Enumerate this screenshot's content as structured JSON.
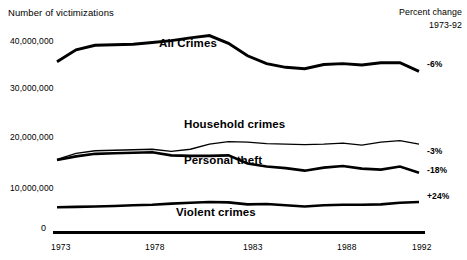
{
  "chart_data": {
    "type": "line",
    "title": "",
    "ylabel": "Number of victimizations",
    "xlabel": "",
    "x": [
      1973,
      1974,
      1975,
      1976,
      1977,
      1978,
      1979,
      1980,
      1981,
      1982,
      1983,
      1984,
      1985,
      1986,
      1987,
      1988,
      1989,
      1990,
      1991,
      1992
    ],
    "xlim": [
      1973,
      1992
    ],
    "ylim": [
      0,
      44000000
    ],
    "xticks": [
      "1973",
      "1978",
      "1983",
      "1988",
      "1992"
    ],
    "yticks": [
      "0",
      "10,000,000",
      "20,000,000",
      "30,000,000",
      "40,000,000"
    ],
    "grid": false,
    "legend": "inline-labels",
    "series": [
      {
        "name": "All Crimes",
        "percent_change_label": "-6%",
        "values": [
          35700000,
          38300000,
          39300000,
          39400000,
          39500000,
          39900000,
          40300000,
          40900000,
          41400000,
          39700000,
          37000000,
          35300000,
          34500000,
          34200000,
          35100000,
          35300000,
          35000000,
          35500000,
          35500000,
          33600000
        ]
      },
      {
        "name": "Household crimes",
        "percent_change_label": "-3%",
        "values": [
          15600000,
          16800000,
          17300000,
          17400000,
          17500000,
          17600000,
          17200000,
          17600000,
          18600000,
          19100000,
          19000000,
          18700000,
          18600000,
          18500000,
          18600000,
          18800000,
          18400000,
          19000000,
          19300000,
          18600000
        ]
      },
      {
        "name": "Personal theft",
        "percent_change_label": "-18%",
        "values": [
          15500000,
          16200000,
          16700000,
          16800000,
          16900000,
          17000000,
          16400000,
          16300000,
          16300000,
          16400000,
          14800000,
          14200000,
          13900000,
          13400000,
          14000000,
          14300000,
          13800000,
          13600000,
          14200000,
          13000000
        ]
      },
      {
        "name": "Violent crimes",
        "percent_change_label": "+24%",
        "values": [
          5300000,
          5400000,
          5500000,
          5600000,
          5800000,
          5900000,
          6200000,
          6400000,
          6600000,
          6500000,
          6000000,
          6100000,
          5800000,
          5500000,
          5800000,
          5900000,
          5900000,
          6000000,
          6400000,
          6600000
        ]
      }
    ],
    "percent_change": {
      "header_line1": "Percent change",
      "header_line2": "1973-92"
    }
  }
}
